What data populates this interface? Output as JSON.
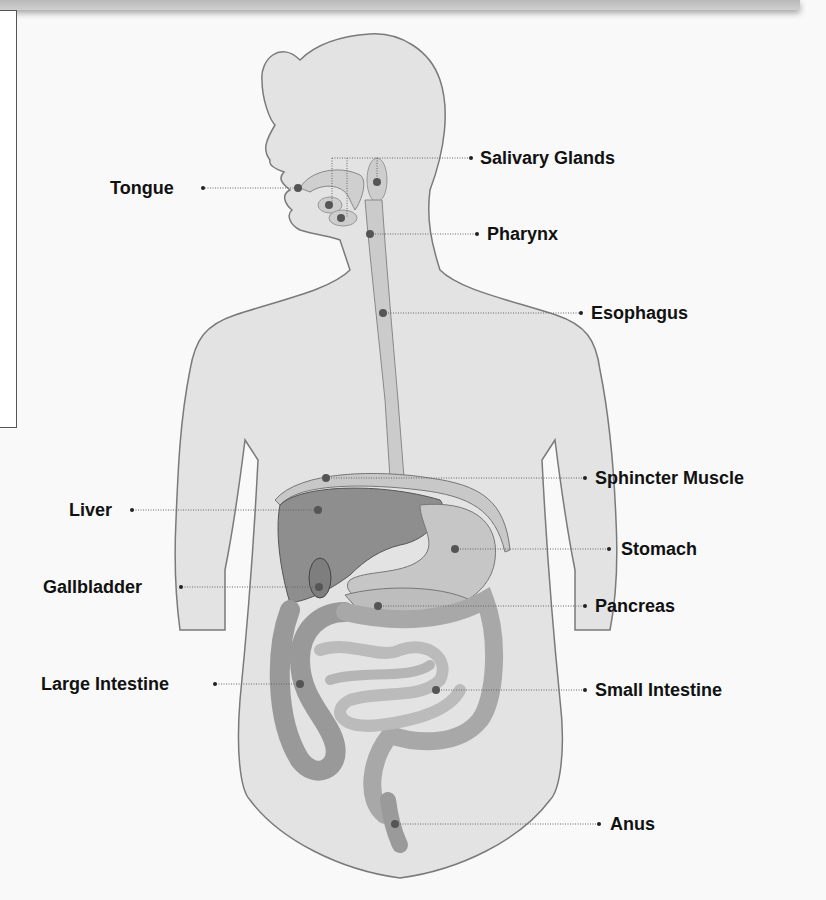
{
  "diagram": {
    "colors": {
      "body_fill": "#e3e3e3",
      "outline": "#7a7a7a",
      "liver": "#8e8e8e",
      "organ": "#c9c9c9",
      "marker": "#555555",
      "leader": "#666666",
      "label_text": "#111111"
    },
    "labels_left": [
      {
        "id": "tongue",
        "text": "Tongue"
      },
      {
        "id": "liver",
        "text": "Liver"
      },
      {
        "id": "gallbladder",
        "text": "Gallbladder"
      },
      {
        "id": "large-intestine",
        "text": "Large Intestine"
      }
    ],
    "labels_right": [
      {
        "id": "salivary-glands",
        "text": "Salivary Glands"
      },
      {
        "id": "pharynx",
        "text": "Pharynx"
      },
      {
        "id": "esophagus",
        "text": "Esophagus"
      },
      {
        "id": "sphincter-muscle",
        "text": "Sphincter Muscle"
      },
      {
        "id": "stomach",
        "text": "Stomach"
      },
      {
        "id": "pancreas",
        "text": "Pancreas"
      },
      {
        "id": "small-intestine",
        "text": "Small Intestine"
      },
      {
        "id": "anus",
        "text": "Anus"
      }
    ]
  }
}
